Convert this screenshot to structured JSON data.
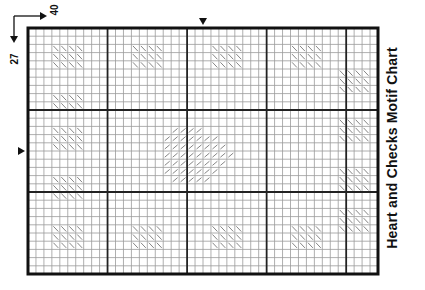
{
  "title": "Heart and Checks Motif Chart",
  "stitch_count": {
    "width_label": "40",
    "height_label": "27"
  },
  "grid": {
    "cols": 44,
    "rows": 30,
    "cell": 8,
    "origin": [
      28,
      28
    ],
    "major_every": 10,
    "line_color": "#9a9a9a",
    "major_color": "#222222",
    "border_color": "#111111",
    "hatch_color": "#777777"
  },
  "center_markers": {
    "top_col": 22,
    "left_row": 15
  },
  "hatch_blocks": [
    {
      "col": 3,
      "row": 2,
      "w": 4,
      "h": 3
    },
    {
      "col": 13,
      "row": 2,
      "w": 4,
      "h": 3
    },
    {
      "col": 23,
      "row": 2,
      "w": 4,
      "h": 3
    },
    {
      "col": 33,
      "row": 2,
      "w": 4,
      "h": 3
    },
    {
      "col": 3,
      "row": 8,
      "w": 4,
      "h": 2
    },
    {
      "col": 3,
      "row": 12,
      "w": 4,
      "h": 3
    },
    {
      "col": 3,
      "row": 18,
      "w": 4,
      "h": 3
    },
    {
      "col": 3,
      "row": 24,
      "w": 4,
      "h": 3
    },
    {
      "col": 13,
      "row": 24,
      "w": 4,
      "h": 3
    },
    {
      "col": 23,
      "row": 24,
      "w": 4,
      "h": 3
    },
    {
      "col": 33,
      "row": 24,
      "w": 4,
      "h": 3
    },
    {
      "col": 39,
      "row": 5,
      "w": 4,
      "h": 3
    },
    {
      "col": 39,
      "row": 11,
      "w": 4,
      "h": 3
    },
    {
      "col": 39,
      "row": 17,
      "w": 4,
      "h": 3
    },
    {
      "col": 39,
      "row": 22,
      "w": 4,
      "h": 3
    }
  ],
  "heart_rows": [
    {
      "row": 12,
      "from": 18,
      "to": 21
    },
    {
      "row": 13,
      "from": 17,
      "to": 23
    },
    {
      "row": 14,
      "from": 17,
      "to": 24
    },
    {
      "row": 15,
      "from": 17,
      "to": 25
    },
    {
      "row": 16,
      "from": 17,
      "to": 24
    },
    {
      "row": 17,
      "from": 17,
      "to": 23
    },
    {
      "row": 18,
      "from": 18,
      "to": 22
    }
  ]
}
